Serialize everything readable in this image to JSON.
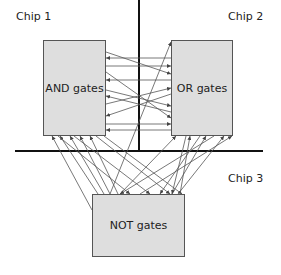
{
  "chips": [
    {
      "label": "Chip 1"
    },
    {
      "label": "Chip 2"
    },
    {
      "label": "Chip 3"
    }
  ],
  "blocks": {
    "and": "AND gates",
    "or": "OR gates",
    "not": "NOT gates"
  },
  "colors": {
    "box_fill": "#dedede",
    "line": "#555555",
    "divider": "#111111"
  }
}
